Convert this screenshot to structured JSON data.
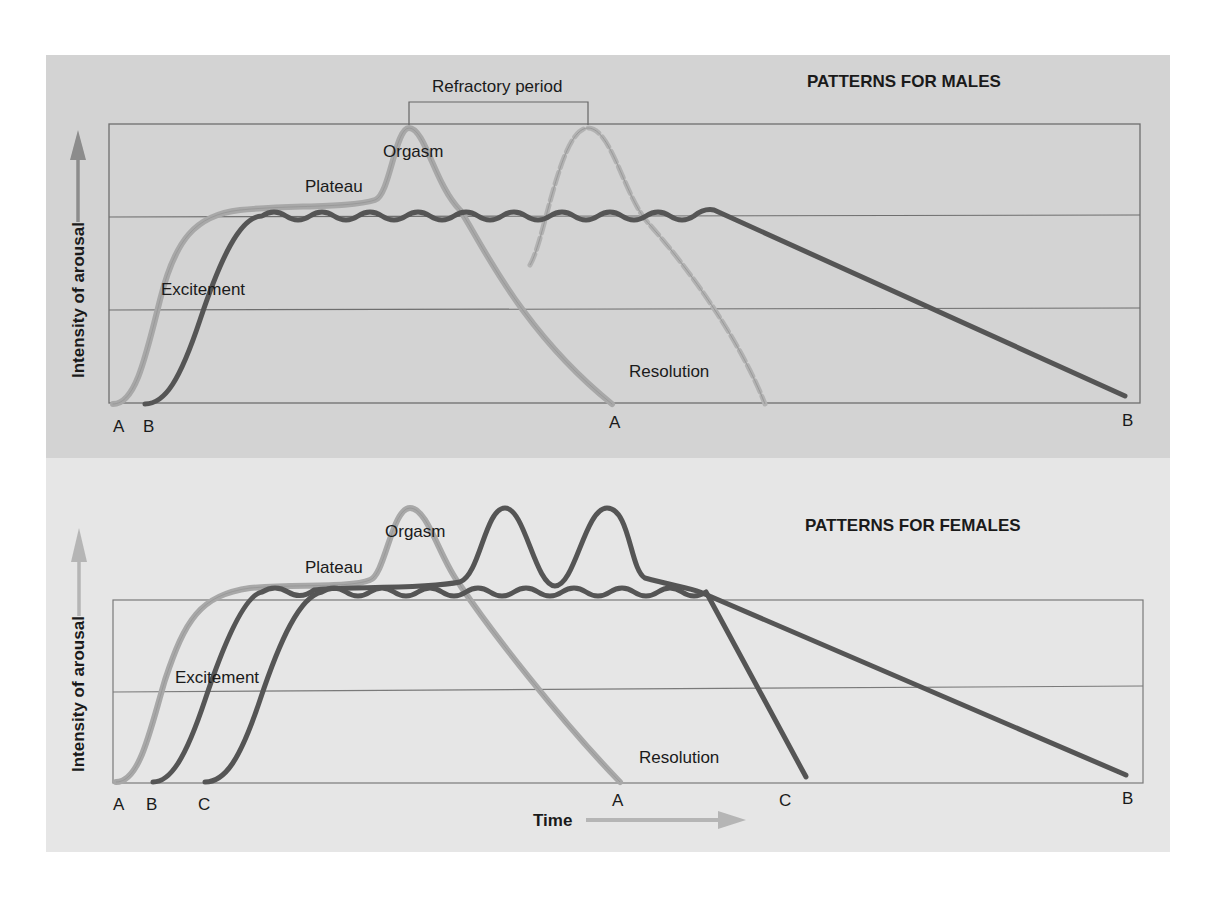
{
  "figure": {
    "colors": {
      "panel_top_bg": "#d3d3d3",
      "panel_bottom_bg": "#e6e6e6",
      "curve_light": "#a8a8a8",
      "curve_dark": "#555555",
      "grid": "#6e6e6e",
      "axis_arrow": "#8c8c8c",
      "axis_arrow_light": "#b5b5b5"
    },
    "males": {
      "title": "PATTERNS FOR MALES",
      "y_axis_label": "Intensity of arousal",
      "annotation_bracket": "Refractory period",
      "phase_labels": {
        "excitement": "Excitement",
        "plateau": "Plateau",
        "orgasm": "Orgasm",
        "resolution": "Resolution"
      },
      "x_markers": {
        "start_a": "A",
        "start_b": "B",
        "end_a": "A",
        "end_b": "B"
      }
    },
    "females": {
      "title": "PATTERNS FOR FEMALES",
      "y_axis_label": "Intensity of arousal",
      "x_axis_label": "Time",
      "phase_labels": {
        "excitement": "Excitement",
        "plateau": "Plateau",
        "orgasm": "Orgasm",
        "resolution": "Resolution"
      },
      "x_markers": {
        "start_a": "A",
        "start_b": "B",
        "start_c": "C",
        "end_a": "A",
        "end_c": "C",
        "end_b": "B"
      }
    }
  }
}
